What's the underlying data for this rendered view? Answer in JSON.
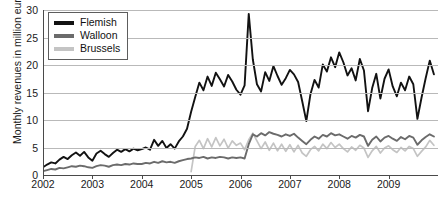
{
  "chart_data": {
    "type": "line",
    "title": "",
    "xlabel": "",
    "ylabel": "Monthly revenues in million euros",
    "ylim": [
      0,
      30
    ],
    "yticks": [
      0,
      5,
      10,
      15,
      20,
      25,
      30
    ],
    "xlim": [
      2002.0,
      2010.0
    ],
    "xticks": [
      2002,
      2003,
      2004,
      2005,
      2006,
      2007,
      2008,
      2009
    ],
    "xtick_labels": [
      "2002",
      "2003",
      "2004",
      "2005",
      "2006",
      "2007",
      "2008",
      "2009"
    ],
    "grid": "horizontal",
    "legend_position": "top-left",
    "colors": {
      "flemish": "#121212",
      "walloon": "#6b6b6b",
      "brussels": "#c4c4c4",
      "gridline": "#b9b9b9",
      "axis": "#4a4a4a",
      "background": "#ffffff"
    },
    "series": [
      {
        "name": "Flemish",
        "color": "#121212",
        "x": [
          2002.0,
          2002.083,
          2002.167,
          2002.25,
          2002.333,
          2002.417,
          2002.5,
          2002.583,
          2002.667,
          2002.75,
          2002.833,
          2002.917,
          2003.0,
          2003.083,
          2003.167,
          2003.25,
          2003.333,
          2003.417,
          2003.5,
          2003.583,
          2003.667,
          2003.75,
          2003.833,
          2003.917,
          2004.0,
          2004.083,
          2004.167,
          2004.25,
          2004.333,
          2004.417,
          2004.5,
          2004.583,
          2004.667,
          2004.75,
          2004.833,
          2004.917,
          2005.0,
          2005.083,
          2005.167,
          2005.25,
          2005.333,
          2005.417,
          2005.5,
          2005.583,
          2005.667,
          2005.75,
          2005.833,
          2005.917,
          2006.0,
          2006.083,
          2006.167,
          2006.25,
          2006.333,
          2006.417,
          2006.5,
          2006.583,
          2006.667,
          2006.75,
          2006.833,
          2006.917,
          2007.0,
          2007.083,
          2007.167,
          2007.25,
          2007.333,
          2007.417,
          2007.5,
          2007.583,
          2007.667,
          2007.75,
          2007.833,
          2007.917,
          2008.0,
          2008.083,
          2008.167,
          2008.25,
          2008.333,
          2008.417,
          2008.5,
          2008.583,
          2008.667,
          2008.75,
          2008.833,
          2008.917,
          2009.0,
          2009.083,
          2009.167,
          2009.25,
          2009.333,
          2009.417,
          2009.5,
          2009.583,
          2009.667,
          2009.75,
          2009.833,
          2009.917
        ],
        "values": [
          1.4,
          1.9,
          2.3,
          2.1,
          2.8,
          3.3,
          2.9,
          3.6,
          4.1,
          3.5,
          4.2,
          3.2,
          2.6,
          3.9,
          4.4,
          3.8,
          3.3,
          4.0,
          4.6,
          4.2,
          4.7,
          4.3,
          4.8,
          4.5,
          4.7,
          5.0,
          4.6,
          6.4,
          5.3,
          6.2,
          4.9,
          5.6,
          4.8,
          6.1,
          7.0,
          8.4,
          11.5,
          14.2,
          16.8,
          15.4,
          17.9,
          16.2,
          18.6,
          17.4,
          16.1,
          18.2,
          17.0,
          15.5,
          14.6,
          16.3,
          29.3,
          21.0,
          16.5,
          15.2,
          18.7,
          17.1,
          19.8,
          18.0,
          16.4,
          17.6,
          19.1,
          18.3,
          16.9,
          13.4,
          9.8,
          14.7,
          17.3,
          15.9,
          20.1,
          18.8,
          21.4,
          19.6,
          22.3,
          20.5,
          18.1,
          19.4,
          17.2,
          21.1,
          19.0,
          11.6,
          15.8,
          18.4,
          13.9,
          17.5,
          19.2,
          16.1,
          14.3,
          16.8,
          15.4,
          17.9,
          16.5,
          10.2,
          14.1,
          17.6,
          20.8,
          18.3
        ]
      },
      {
        "name": "Walloon",
        "color": "#6b6b6b",
        "x": [
          2002.0,
          2002.083,
          2002.167,
          2002.25,
          2002.333,
          2002.417,
          2002.5,
          2002.583,
          2002.667,
          2002.75,
          2002.833,
          2002.917,
          2003.0,
          2003.083,
          2003.167,
          2003.25,
          2003.333,
          2003.417,
          2003.5,
          2003.583,
          2003.667,
          2003.75,
          2003.833,
          2003.917,
          2004.0,
          2004.083,
          2004.167,
          2004.25,
          2004.333,
          2004.417,
          2004.5,
          2004.583,
          2004.667,
          2004.75,
          2004.833,
          2004.917,
          2005.0,
          2005.083,
          2005.167,
          2005.25,
          2005.333,
          2005.417,
          2005.5,
          2005.583,
          2005.667,
          2005.75,
          2005.833,
          2005.917,
          2006.0,
          2006.083,
          2006.167,
          2006.25,
          2006.333,
          2006.417,
          2006.5,
          2006.583,
          2006.667,
          2006.75,
          2006.833,
          2006.917,
          2007.0,
          2007.083,
          2007.167,
          2007.25,
          2007.333,
          2007.417,
          2007.5,
          2007.583,
          2007.667,
          2007.75,
          2007.833,
          2007.917,
          2008.0,
          2008.083,
          2008.167,
          2008.25,
          2008.333,
          2008.417,
          2008.5,
          2008.583,
          2008.667,
          2008.75,
          2008.833,
          2008.917,
          2009.0,
          2009.083,
          2009.167,
          2009.25,
          2009.333,
          2009.417,
          2009.5,
          2009.583,
          2009.667,
          2009.75,
          2009.833,
          2009.917
        ],
        "values": [
          0.7,
          0.9,
          1.1,
          1.0,
          1.3,
          1.2,
          1.4,
          1.6,
          1.5,
          1.7,
          1.6,
          1.4,
          1.3,
          1.6,
          1.8,
          1.7,
          1.5,
          1.8,
          1.9,
          1.8,
          2.0,
          1.9,
          2.1,
          2.0,
          2.0,
          2.2,
          2.1,
          2.4,
          2.2,
          2.5,
          2.3,
          2.4,
          2.2,
          2.5,
          2.7,
          2.9,
          3.0,
          3.2,
          3.1,
          3.3,
          3.0,
          3.2,
          3.1,
          3.3,
          3.2,
          3.0,
          3.2,
          3.1,
          3.2,
          3.0,
          5.6,
          7.4,
          7.0,
          7.6,
          7.2,
          7.8,
          7.5,
          7.3,
          7.0,
          7.4,
          7.1,
          7.5,
          6.8,
          6.2,
          5.6,
          6.4,
          7.0,
          6.6,
          7.3,
          7.0,
          7.6,
          7.2,
          7.4,
          7.0,
          6.6,
          7.1,
          6.8,
          7.3,
          7.0,
          5.3,
          6.4,
          7.0,
          6.1,
          6.8,
          7.1,
          6.6,
          6.2,
          6.9,
          6.5,
          7.1,
          6.8,
          5.5,
          6.3,
          6.9,
          7.4,
          7.0
        ]
      },
      {
        "name": "Brussels",
        "color": "#c4c4c4",
        "x": [
          2005.0,
          2005.083,
          2005.167,
          2005.25,
          2005.333,
          2005.417,
          2005.5,
          2005.583,
          2005.667,
          2005.75,
          2005.833,
          2005.917,
          2006.0,
          2006.083,
          2006.167,
          2006.25,
          2006.333,
          2006.417,
          2006.5,
          2006.583,
          2006.667,
          2006.75,
          2006.833,
          2006.917,
          2007.0,
          2007.083,
          2007.167,
          2007.25,
          2007.333,
          2007.417,
          2007.5,
          2007.583,
          2007.667,
          2007.75,
          2007.833,
          2007.917,
          2008.0,
          2008.083,
          2008.167,
          2008.25,
          2008.333,
          2008.417,
          2008.5,
          2008.583,
          2008.667,
          2008.75,
          2008.833,
          2008.917,
          2009.0,
          2009.083,
          2009.167,
          2009.25,
          2009.333,
          2009.417,
          2009.5,
          2009.583,
          2009.667,
          2009.75,
          2009.833,
          2009.917
        ],
        "values": [
          0.6,
          5.2,
          6.3,
          4.8,
          6.6,
          5.1,
          6.8,
          5.3,
          6.5,
          4.9,
          6.2,
          5.4,
          5.8,
          4.6,
          6.4,
          7.6,
          6.2,
          4.8,
          6.0,
          4.5,
          5.8,
          4.4,
          5.6,
          4.3,
          5.5,
          4.2,
          5.4,
          4.0,
          3.4,
          4.6,
          5.2,
          4.4,
          5.6,
          4.8,
          5.9,
          5.0,
          5.6,
          4.8,
          4.2,
          5.1,
          4.5,
          5.4,
          4.9,
          3.2,
          4.4,
          5.2,
          4.0,
          4.9,
          5.3,
          4.6,
          4.1,
          5.0,
          4.4,
          5.2,
          4.8,
          3.4,
          4.3,
          5.1,
          6.3,
          5.4
        ]
      }
    ]
  },
  "legend": {
    "items": [
      {
        "label": "Flemish"
      },
      {
        "label": "Walloon"
      },
      {
        "label": "Brussels"
      }
    ]
  }
}
